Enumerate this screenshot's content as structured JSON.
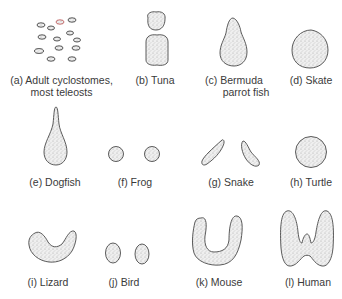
{
  "figure": {
    "panels": [
      {
        "id": "a",
        "label_line1": "(a) Adult cyclostomes,",
        "label_line2": "most teleosts"
      },
      {
        "id": "b",
        "label_line1": "(b) Tuna"
      },
      {
        "id": "c",
        "label_line1": "(c) Bermuda",
        "label_line2": "parrot fish"
      },
      {
        "id": "d",
        "label_line1": "(d) Skate"
      },
      {
        "id": "e",
        "label_line1": "(e) Dogfish"
      },
      {
        "id": "f",
        "label_line1": "(f) Frog"
      },
      {
        "id": "g",
        "label_line1": "(g) Snake"
      },
      {
        "id": "h",
        "label_line1": "(h) Turtle"
      },
      {
        "id": "i",
        "label_line1": "(i) Lizard"
      },
      {
        "id": "j",
        "label_line1": "(j) Bird"
      },
      {
        "id": "k",
        "label_line1": "(k) Mouse"
      },
      {
        "id": "l",
        "label_line1": "(l) Human"
      }
    ],
    "colors": {
      "background": "#ffffff",
      "outline": "#4a4a4a",
      "stipple": "#bdbdbd",
      "text": "#3a3a3a",
      "follicle_accent": "#d08a8a"
    }
  }
}
